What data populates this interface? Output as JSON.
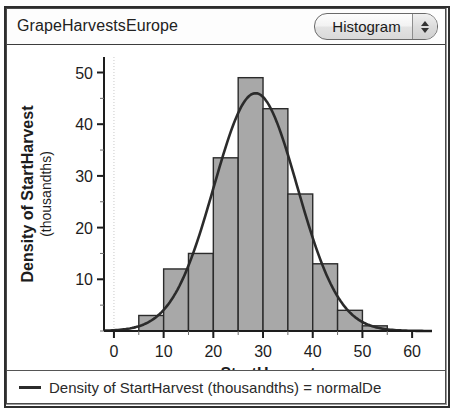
{
  "window": {
    "title": "GrapeHarvestsEurope"
  },
  "controls": {
    "plot_type_label": "Histogram",
    "stepper_up_icon": "triangle-up-icon",
    "stepper_down_icon": "triangle-down-icon"
  },
  "legend": {
    "line_swatch_icon": "line-swatch-icon",
    "entry": "Density of StartHarvest (thousandths) = normalDe"
  },
  "chart_data": {
    "type": "bar",
    "title": "",
    "xlabel": "StartHarvest",
    "ylabel": "Density of StartHarvest (thousandths)",
    "xlim": [
      -2,
      64
    ],
    "ylim": [
      0,
      53
    ],
    "xticks": [
      0,
      10,
      20,
      30,
      40,
      50,
      60
    ],
    "xticklabels": [
      "0",
      "10",
      "20",
      "30",
      "40",
      "50",
      "60"
    ],
    "yticks": [
      10,
      20,
      30,
      40,
      50
    ],
    "yticklabels": [
      "10",
      "20",
      "30",
      "40",
      "50"
    ],
    "minor_tick_step": 5,
    "grid": false,
    "zero_gridline_x": 0,
    "bin_width": 5,
    "bin_starts": [
      5,
      10,
      15,
      20,
      25,
      30,
      35,
      40,
      45,
      50
    ],
    "values": [
      3,
      12,
      15,
      33.5,
      49,
      43,
      26.5,
      13,
      4,
      1
    ],
    "bar_fill_color": "#a8a8a8",
    "bar_edge_color": "#2b2b2b",
    "overlay": {
      "name": "normal density curve",
      "type": "line",
      "color": "#2b2b2b",
      "mean": 28.5,
      "sd": 8.4,
      "peak_value": 46
    }
  }
}
